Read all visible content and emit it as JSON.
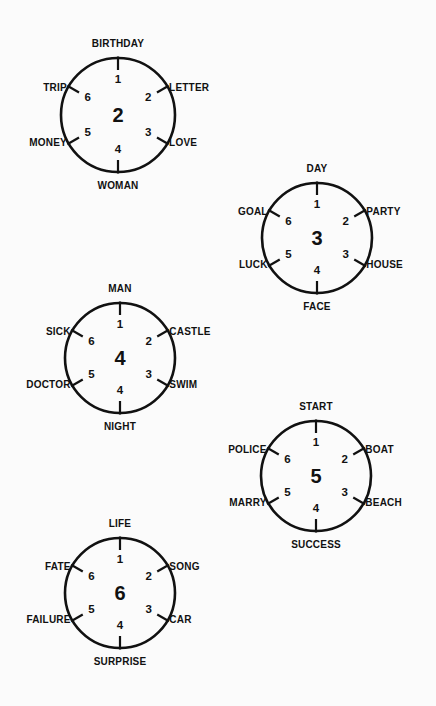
{
  "page": {
    "background_color": "#fbfbfb",
    "ink_color": "#111111",
    "width": 436,
    "height": 706
  },
  "chart_data": {
    "type": "diagram",
    "position_angles_deg": {
      "1": 0,
      "2": 60,
      "3": 120,
      "4": 180,
      "5": 240,
      "6": 300
    },
    "wheels": [
      {
        "center_label": "2",
        "cx": 118,
        "cy": 115,
        "r": 57,
        "positions": [
          {
            "num": "1",
            "word": "BIRTHDAY",
            "align": "c"
          },
          {
            "num": "2",
            "word": "LETTER",
            "align": "r"
          },
          {
            "num": "3",
            "word": "LOVE",
            "align": "r"
          },
          {
            "num": "4",
            "word": "WOMAN",
            "align": "c"
          },
          {
            "num": "5",
            "word": "MONEY",
            "align": "l"
          },
          {
            "num": "6",
            "word": "TRIP",
            "align": "l"
          }
        ]
      },
      {
        "center_label": "3",
        "cx": 317,
        "cy": 238,
        "r": 55,
        "positions": [
          {
            "num": "1",
            "word": "DAY",
            "align": "c"
          },
          {
            "num": "2",
            "word": "PARTY",
            "align": "r"
          },
          {
            "num": "3",
            "word": "HOUSE",
            "align": "r"
          },
          {
            "num": "4",
            "word": "FACE",
            "align": "c"
          },
          {
            "num": "5",
            "word": "LUCK",
            "align": "l"
          },
          {
            "num": "6",
            "word": "GOAL",
            "align": "l"
          }
        ]
      },
      {
        "center_label": "4",
        "cx": 120,
        "cy": 358,
        "r": 55,
        "positions": [
          {
            "num": "1",
            "word": "MAN",
            "align": "c"
          },
          {
            "num": "2",
            "word": "CASTLE",
            "align": "r"
          },
          {
            "num": "3",
            "word": "SWIM",
            "align": "r"
          },
          {
            "num": "4",
            "word": "NIGHT",
            "align": "c"
          },
          {
            "num": "5",
            "word": "DOCTOR",
            "align": "l"
          },
          {
            "num": "6",
            "word": "SICK",
            "align": "l"
          }
        ]
      },
      {
        "center_label": "5",
        "cx": 316,
        "cy": 476,
        "r": 55,
        "positions": [
          {
            "num": "1",
            "word": "START",
            "align": "c"
          },
          {
            "num": "2",
            "word": "BOAT",
            "align": "r"
          },
          {
            "num": "3",
            "word": "BEACH",
            "align": "r"
          },
          {
            "num": "4",
            "word": "SUCCESS",
            "align": "c"
          },
          {
            "num": "5",
            "word": "MARRY",
            "align": "l"
          },
          {
            "num": "6",
            "word": "POLICE",
            "align": "l"
          }
        ]
      },
      {
        "center_label": "6",
        "cx": 120,
        "cy": 593,
        "r": 55,
        "positions": [
          {
            "num": "1",
            "word": "LIFE",
            "align": "c"
          },
          {
            "num": "2",
            "word": "SONG",
            "align": "r"
          },
          {
            "num": "3",
            "word": "CAR",
            "align": "r"
          },
          {
            "num": "4",
            "word": "SURPRISE",
            "align": "c"
          },
          {
            "num": "5",
            "word": "FAILURE",
            "align": "l"
          },
          {
            "num": "6",
            "word": "FATE",
            "align": "l"
          }
        ]
      }
    ]
  }
}
